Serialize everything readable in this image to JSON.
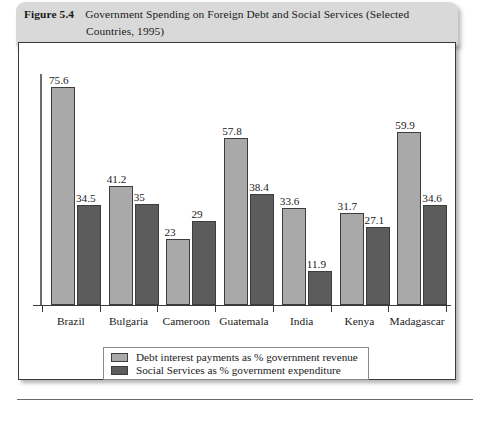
{
  "figure": {
    "number": "Figure 5.4",
    "title_line1": "Government Spending on Foreign Debt and Social Services (Selected",
    "title_line2": "Countries, 1995)"
  },
  "colors": {
    "series1": "#a9a9a9",
    "series2": "#5c5c5c",
    "header_band": "#d9d9d9",
    "axis": "#3a3a3a"
  },
  "chart_data": {
    "type": "bar",
    "title": "Government Spending on Foreign Debt and Social Services (Selected Countries, 1995)",
    "xlabel": "",
    "ylabel": "",
    "ylim": [
      0,
      80
    ],
    "grid": false,
    "legend_position": "bottom",
    "categories": [
      "Brazil",
      "Bulgaria",
      "Cameroon",
      "Guatemala",
      "India",
      "Kenya",
      "Madagascar"
    ],
    "series": [
      {
        "name": "Debt interest payments as % government revenue",
        "color": "#a9a9a9",
        "values": [
          75.6,
          41.2,
          23,
          57.8,
          33.6,
          31.7,
          59.9
        ],
        "labels": [
          "75.6",
          "41.2",
          "23",
          "57.8",
          "33.6",
          "31.7",
          "59.9"
        ]
      },
      {
        "name": "Social Services as % government expenditure",
        "color": "#5c5c5c",
        "values": [
          34.5,
          35,
          29,
          38.4,
          11.9,
          27.1,
          34.6
        ],
        "labels": [
          "34.5",
          "35",
          "29",
          "38.4",
          "11.9",
          "27.1",
          "34.6"
        ]
      }
    ]
  },
  "legend": {
    "items": [
      {
        "label": "Debt interest payments as % government revenue",
        "swatch": "light"
      },
      {
        "label": "Social Services as % government expenditure",
        "swatch": "dark"
      }
    ]
  }
}
